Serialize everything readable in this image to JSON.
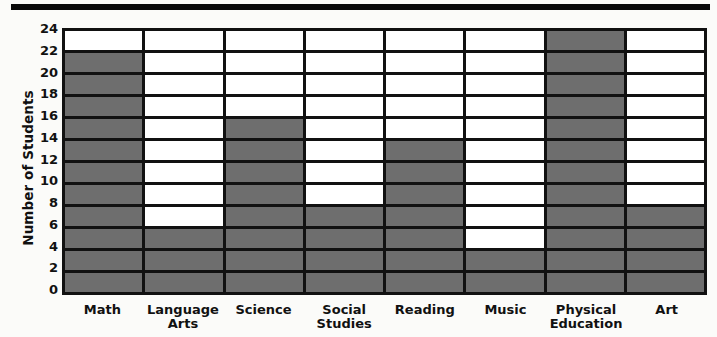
{
  "chart_data": {
    "type": "bar",
    "title": "",
    "xlabel": "",
    "ylabel": "Number of Students",
    "ylim": [
      0,
      24
    ],
    "ytick_step": 2,
    "yticks": [
      24,
      22,
      20,
      18,
      16,
      14,
      12,
      10,
      8,
      6,
      4,
      2,
      0
    ],
    "grid": true,
    "legend": null,
    "bar_color": "#6e6e6e",
    "axis_color": "#111111",
    "background": "#ffffff",
    "categories": [
      "Math",
      "Language\nArts",
      "Science",
      "Social\nStudies",
      "Reading",
      "Music",
      "Physical\nEducation",
      "Art"
    ],
    "values": [
      22,
      6,
      16,
      8,
      14,
      4,
      24,
      8
    ]
  },
  "decor": {
    "top_rule": ""
  }
}
